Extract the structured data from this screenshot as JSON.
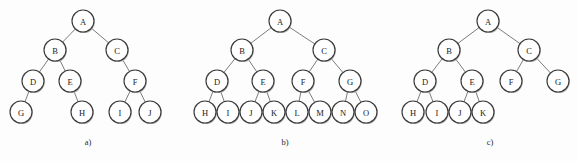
{
  "figure": {
    "background_color": "#fdfdfd",
    "node_fill_color": "#ffffff",
    "node_stroke_color": "#3a3a3a",
    "edge_color": "#6d6d6d",
    "node_radius": 11,
    "width": 577,
    "height": 161
  },
  "diagrams": [
    {
      "id": "tree-a",
      "caption": "a)",
      "caption_x": 88,
      "caption_y": 142,
      "node_count": 10,
      "nodes": [
        {
          "label": "A",
          "x": 83,
          "y": 21
        },
        {
          "label": "B",
          "x": 55,
          "y": 50
        },
        {
          "label": "C",
          "x": 117,
          "y": 50
        },
        {
          "label": "D",
          "x": 33,
          "y": 81
        },
        {
          "label": "E",
          "x": 70,
          "y": 81
        },
        {
          "label": "F",
          "x": 135,
          "y": 81
        },
        {
          "label": "G",
          "x": 21,
          "y": 112
        },
        {
          "label": "H",
          "x": 82,
          "y": 112
        },
        {
          "label": "I",
          "x": 120,
          "y": 112
        },
        {
          "label": "J",
          "x": 150,
          "y": 112
        }
      ],
      "edges": [
        {
          "from": "A",
          "to": "B"
        },
        {
          "from": "A",
          "to": "C"
        },
        {
          "from": "B",
          "to": "D"
        },
        {
          "from": "B",
          "to": "E"
        },
        {
          "from": "C",
          "to": "F"
        },
        {
          "from": "D",
          "to": "G"
        },
        {
          "from": "E",
          "to": "H"
        },
        {
          "from": "F",
          "to": "I"
        },
        {
          "from": "F",
          "to": "J"
        }
      ]
    },
    {
      "id": "tree-b",
      "caption": "b)",
      "caption_x": 285,
      "caption_y": 142,
      "node_count": 15,
      "nodes": [
        {
          "label": "A",
          "x": 280,
          "y": 21
        },
        {
          "label": "B",
          "x": 242,
          "y": 50
        },
        {
          "label": "C",
          "x": 324,
          "y": 50
        },
        {
          "label": "D",
          "x": 217,
          "y": 81
        },
        {
          "label": "E",
          "x": 263,
          "y": 81
        },
        {
          "label": "F",
          "x": 303,
          "y": 81
        },
        {
          "label": "G",
          "x": 350,
          "y": 81
        },
        {
          "label": "H",
          "x": 205,
          "y": 112
        },
        {
          "label": "I",
          "x": 228,
          "y": 112
        },
        {
          "label": "J",
          "x": 251,
          "y": 112
        },
        {
          "label": "K",
          "x": 274,
          "y": 112
        },
        {
          "label": "L",
          "x": 297,
          "y": 112
        },
        {
          "label": "M",
          "x": 320,
          "y": 112
        },
        {
          "label": "N",
          "x": 343,
          "y": 112
        },
        {
          "label": "O",
          "x": 366,
          "y": 112
        }
      ],
      "edges": [
        {
          "from": "A",
          "to": "B"
        },
        {
          "from": "A",
          "to": "C"
        },
        {
          "from": "B",
          "to": "D"
        },
        {
          "from": "B",
          "to": "E"
        },
        {
          "from": "C",
          "to": "F"
        },
        {
          "from": "C",
          "to": "G"
        },
        {
          "from": "D",
          "to": "H"
        },
        {
          "from": "D",
          "to": "I"
        },
        {
          "from": "E",
          "to": "J"
        },
        {
          "from": "E",
          "to": "K"
        },
        {
          "from": "F",
          "to": "L"
        },
        {
          "from": "F",
          "to": "M"
        },
        {
          "from": "G",
          "to": "N"
        },
        {
          "from": "G",
          "to": "O"
        }
      ]
    },
    {
      "id": "tree-c",
      "caption": "c)",
      "caption_x": 490,
      "caption_y": 142,
      "node_count": 11,
      "nodes": [
        {
          "label": "A",
          "x": 488,
          "y": 21
        },
        {
          "label": "B",
          "x": 449,
          "y": 50
        },
        {
          "label": "C",
          "x": 529,
          "y": 50
        },
        {
          "label": "D",
          "x": 425,
          "y": 81
        },
        {
          "label": "E",
          "x": 472,
          "y": 81
        },
        {
          "label": "F",
          "x": 511,
          "y": 81
        },
        {
          "label": "G",
          "x": 558,
          "y": 81
        },
        {
          "label": "H",
          "x": 413,
          "y": 112
        },
        {
          "label": "I",
          "x": 437,
          "y": 112
        },
        {
          "label": "J",
          "x": 460,
          "y": 112
        },
        {
          "label": "K",
          "x": 483,
          "y": 112
        }
      ],
      "edges": [
        {
          "from": "A",
          "to": "B"
        },
        {
          "from": "A",
          "to": "C"
        },
        {
          "from": "B",
          "to": "D"
        },
        {
          "from": "B",
          "to": "E"
        },
        {
          "from": "C",
          "to": "F"
        },
        {
          "from": "C",
          "to": "G"
        },
        {
          "from": "D",
          "to": "H"
        },
        {
          "from": "D",
          "to": "I"
        },
        {
          "from": "E",
          "to": "J"
        },
        {
          "from": "E",
          "to": "K"
        }
      ]
    }
  ]
}
